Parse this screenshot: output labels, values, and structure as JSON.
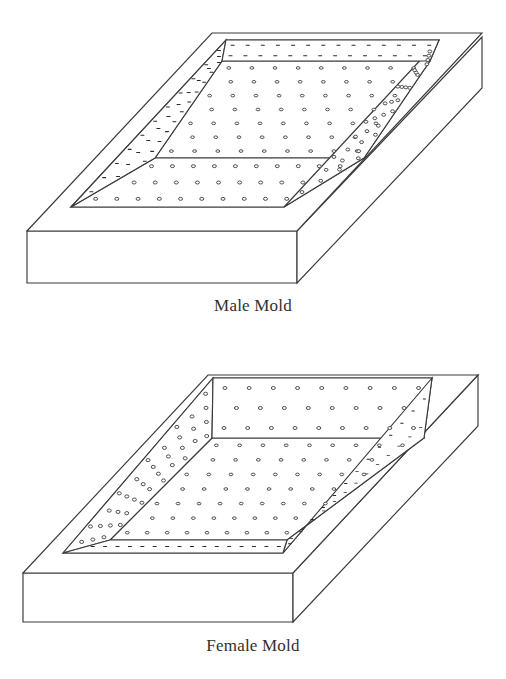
{
  "figure": {
    "background_color": "#ffffff",
    "line_color": "#3a3a3a",
    "text_color": "#332f2f",
    "projection": "isometric-oblique",
    "panel_count": 2
  },
  "panels": [
    {
      "id": "male-mold",
      "caption": "Male Mold",
      "description": "Rectangular slab with a raised truncated-pyramid (male) form; the top plateau and all four sloped faces are perforated with a regular grid of round holes.",
      "cavity_type": "raised-plateau",
      "perforation": {
        "shape": "circle",
        "plateau_rows": 7,
        "plateau_cols": 9,
        "front_slope_rows": 3,
        "left_slope_rows": 3,
        "right_slope_cols": 4,
        "back_slope_rows": 2
      },
      "geometry": {
        "base_front_left": [
          27,
          231
        ],
        "base_front_right": [
          297,
          231
        ],
        "base_bottom_left": [
          27,
          283
        ],
        "base_bottom_right": [
          297,
          283
        ],
        "top_back_left": [
          212,
          33
        ],
        "top_back_right": [
          482,
          33
        ],
        "top_right_front": [
          482,
          84
        ],
        "plateau_back_left": [
          222,
          61
        ],
        "plateau_back_right": [
          430,
          61
        ]
      }
    },
    {
      "id": "female-mold",
      "caption": "Female Mold",
      "description": "Rectangular slab with a recessed truncated-pyramid (female) cavity; the sunken floor and the inward sloping walls are perforated with a regular grid of round holes.",
      "cavity_type": "recessed-cavity",
      "perforation": {
        "shape": "circle",
        "floor_rows": 7,
        "floor_cols": 9,
        "back_wall_rows": 3,
        "left_wall_rows": 4,
        "right_wall_cols": 2,
        "front_wall_rows": 1
      },
      "geometry": {
        "base_front_left": [
          23,
          573
        ],
        "base_front_right": [
          293,
          573
        ],
        "base_bottom_left": [
          23,
          622
        ],
        "base_bottom_right": [
          293,
          622
        ],
        "top_back_left": [
          208,
          375
        ],
        "top_back_right": [
          478,
          375
        ],
        "cavity_back_left": [
          212,
          398
        ],
        "cavity_back_right": [
          424,
          398
        ]
      }
    }
  ]
}
